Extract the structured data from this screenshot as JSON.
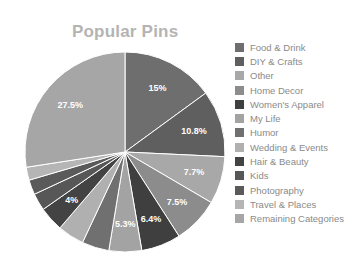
{
  "chart_data": {
    "type": "pie",
    "title": "Popular Pins",
    "start": "12 o'clock",
    "direction": "clockwise",
    "legend_position": "right",
    "slices": [
      {
        "label": "Food & Drink",
        "value": 15,
        "display": "15%",
        "color": "#6e6e6e"
      },
      {
        "label": "DIY & Crafts",
        "value": 10.8,
        "display": "10.8%",
        "color": "#5f5f5f"
      },
      {
        "label": "Other",
        "value": 7.7,
        "display": "7.7%",
        "color": "#a8a8a8"
      },
      {
        "label": "Home Decor",
        "value": 7.5,
        "display": "7.5%",
        "color": "#8c8c8c"
      },
      {
        "label": "Women's Apparel",
        "value": 6.4,
        "display": "6.4%",
        "color": "#3f3f3f"
      },
      {
        "label": "My Life",
        "value": 5.3,
        "display": "5.3%",
        "color": "#a3a3a3"
      },
      {
        "label": "Humor",
        "value": 4.4,
        "display": "",
        "color": "#707070"
      },
      {
        "label": "Wedding & Events",
        "value": 4.3,
        "display": "",
        "color": "#b0b0b0"
      },
      {
        "label": "Hair & Beauty",
        "value": 4,
        "display": "4%",
        "color": "#434343"
      },
      {
        "label": "Kids",
        "value": 2.8,
        "display": "",
        "color": "#575757"
      },
      {
        "label": "Photography",
        "value": 2.4,
        "display": "",
        "color": "#5a5a5a"
      },
      {
        "label": "Travel & Places",
        "value": 2.1,
        "display": "",
        "color": "#b5b5b5"
      },
      {
        "label": "Remaining Categories",
        "value": 27.5,
        "display": "27.5%",
        "color": "#a6a6a6"
      }
    ]
  }
}
